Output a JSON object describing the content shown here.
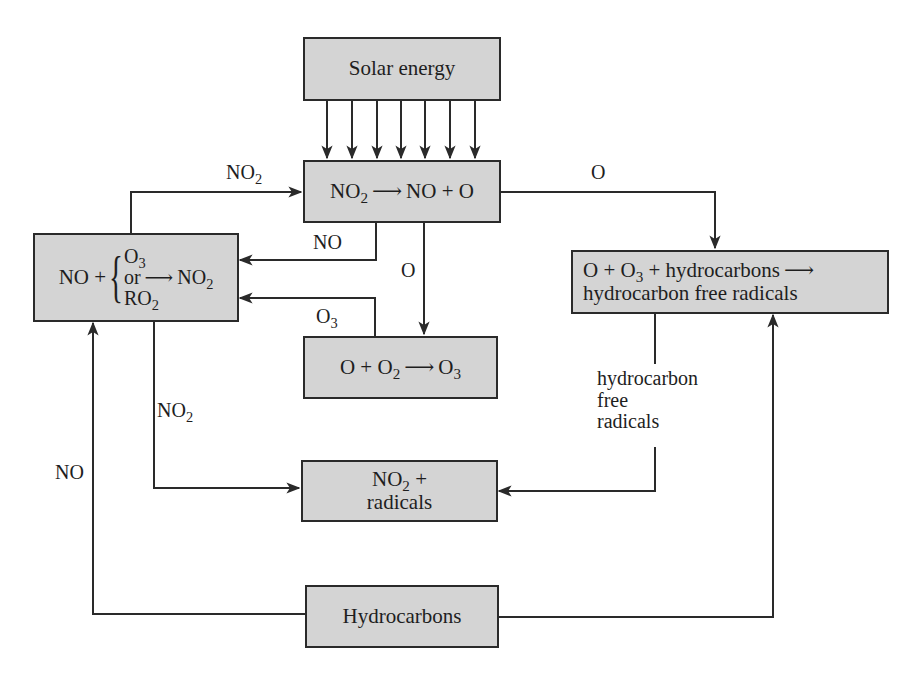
{
  "diagram": {
    "nodes": {
      "solar": {
        "label": "Solar energy"
      },
      "photolysis": {
        "reactant": "NO",
        "reactant_sub": "2",
        "arrow": "⟶",
        "products": "NO + O"
      },
      "no_oxidation": {
        "prefix": "NO +",
        "options": [
          {
            "text": "O",
            "sub": "3"
          },
          {
            "text": "or",
            "sub": ""
          },
          {
            "text": "RO",
            "sub": "2"
          }
        ],
        "arrow": "⟶",
        "product": "NO",
        "product_sub": "2"
      },
      "ozone_formation": {
        "a": "O + O",
        "a_sub": "2",
        "arrow": "⟶",
        "product": "O",
        "product_sub": "3"
      },
      "hydrocarbon_reaction": {
        "line1_a": "O + O",
        "line1_sub": "3",
        "line1_b": " + hydrocarbons",
        "arrow": "⟶",
        "line2": "hydrocarbon free radicals"
      },
      "no2_radicals": {
        "line1": "NO",
        "line1_sub": "2",
        "line1_suffix": " +",
        "line2": "radicals"
      },
      "hydrocarbons": {
        "label": "Hydrocarbons"
      }
    },
    "edge_labels": {
      "no2_top": {
        "text": "NO",
        "sub": "2"
      },
      "o_top_right": {
        "text": "O"
      },
      "no_mid": {
        "text": "NO"
      },
      "o_mid": {
        "text": "O"
      },
      "o3_mid": {
        "text": "O",
        "sub": "3"
      },
      "no2_left": {
        "text": "NO",
        "sub": "2"
      },
      "no_far_left": {
        "text": "NO"
      },
      "hc_radicals": {
        "line1": "hydrocarbon",
        "line2": "free",
        "line3": "radicals"
      }
    },
    "colors": {
      "box_fill": "#d4d4d4",
      "stroke": "#2a2a2a",
      "background": "#ffffff"
    },
    "solar_ray_count": 7
  }
}
